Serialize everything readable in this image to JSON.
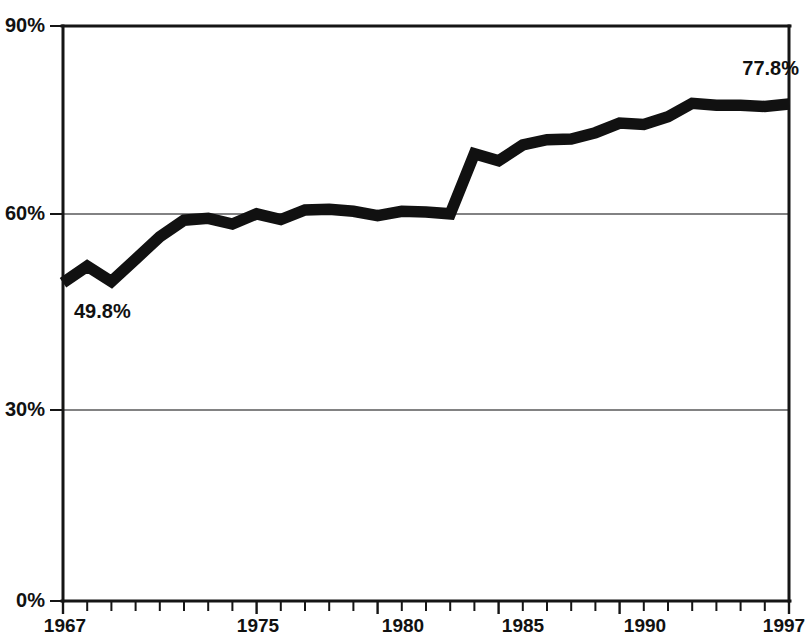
{
  "chart_data": {
    "type": "line",
    "title": "",
    "subtitle": "",
    "xlabel": "",
    "ylabel": "",
    "xlim": [
      1967,
      1997
    ],
    "ylim": [
      0,
      90
    ],
    "yticks": [
      0,
      30,
      60,
      90
    ],
    "ytick_labels": [
      "0%",
      "30%",
      "60%",
      "90%"
    ],
    "xticks": [
      1967,
      1975,
      1980,
      1985,
      1990,
      1997
    ],
    "xtick_labels": [
      "1967",
      "1975",
      "1980",
      "1985",
      "1990",
      "1997"
    ],
    "grid": "horizontal",
    "legend": "none",
    "minor_xticks_every": 1,
    "x": [
      1967,
      1968,
      1969,
      1970,
      1971,
      1972,
      1973,
      1974,
      1975,
      1976,
      1977,
      1978,
      1979,
      1980,
      1981,
      1982,
      1983,
      1984,
      1985,
      1986,
      1987,
      1988,
      1989,
      1990,
      1991,
      1992,
      1993,
      1994,
      1995,
      1996,
      1997
    ],
    "values": [
      49.8,
      52.4,
      50.0,
      53.5,
      57.0,
      59.6,
      59.9,
      59.0,
      60.6,
      59.7,
      61.2,
      61.3,
      61.0,
      60.3,
      61.0,
      60.9,
      60.6,
      70.0,
      68.9,
      71.4,
      72.2,
      72.3,
      73.3,
      74.8,
      74.6,
      75.8,
      77.9,
      77.6,
      77.6,
      77.4,
      77.8
    ],
    "annotations": [
      {
        "name": "start-value-label",
        "text": "49.8%",
        "x": 1967,
        "y": 49.8
      },
      {
        "name": "end-value-label",
        "text": "77.8%",
        "x": 1997,
        "y": 77.8
      }
    ],
    "colors": {
      "line": "#111111",
      "axis": "#151515",
      "grid": "#58585a",
      "background": "#ffffff",
      "text": "#111111"
    }
  }
}
